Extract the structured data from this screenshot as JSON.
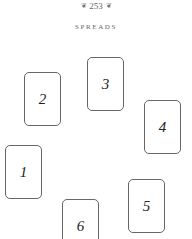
{
  "header": {
    "ornament_left": "❦",
    "page_number": "253",
    "ornament_right": "❦"
  },
  "section": {
    "title": "SPREADS"
  },
  "cards": [
    {
      "number": "1",
      "x": 5,
      "y": 145
    },
    {
      "number": "2",
      "x": 24,
      "y": 72
    },
    {
      "number": "3",
      "x": 87,
      "y": 57
    },
    {
      "number": "4",
      "x": 144,
      "y": 100
    },
    {
      "number": "5",
      "x": 128,
      "y": 179
    },
    {
      "number": "6",
      "x": 62,
      "y": 199
    }
  ],
  "colors": {
    "card_border": "#666666",
    "card_number": "#222222",
    "header_text": "#666666"
  }
}
